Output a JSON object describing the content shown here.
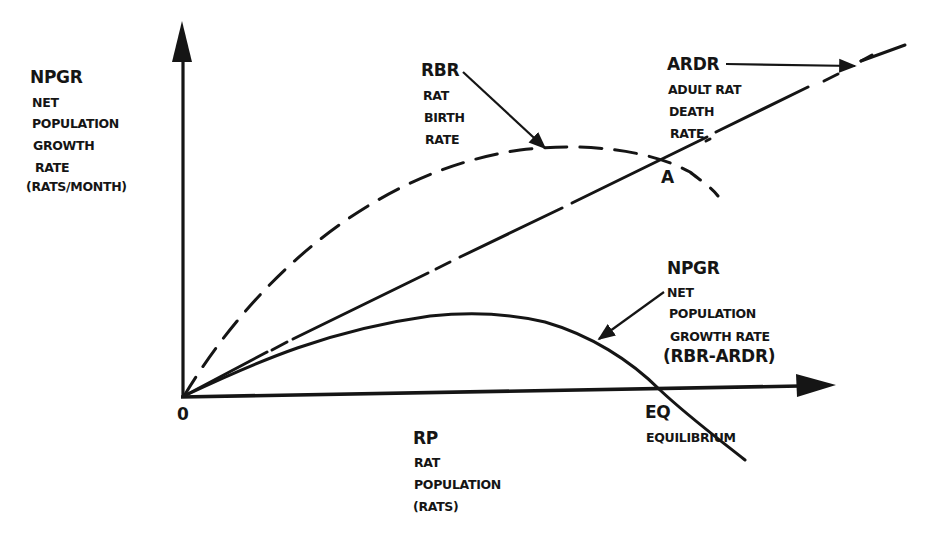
{
  "diagram": {
    "y_axis": {
      "abbr": "NPGR",
      "lines": [
        "NET",
        "POPULATION",
        "GROWTH",
        "RATE",
        "(RATS/MONTH)"
      ]
    },
    "x_axis": {
      "abbr": "RP",
      "lines": [
        "RAT",
        "POPULATION",
        "(RATS)"
      ]
    },
    "origin_label": "0",
    "rbr": {
      "abbr": "RBR",
      "lines": [
        "RAT",
        "BIRTH",
        "RATE"
      ],
      "style": "dashed"
    },
    "ardr": {
      "abbr": "ARDR",
      "lines": [
        "ADULT RAT",
        "DEATH",
        "RATE"
      ],
      "style": "solid-then-dashed straight line"
    },
    "npgr": {
      "abbr": "NPGR",
      "lines": [
        "NET",
        "POPULATION",
        "GROWTH RATE"
      ],
      "formula": "(RBR-ARDR)",
      "style": "solid"
    },
    "point_a": "A",
    "eq": {
      "abbr": "EQ",
      "label": "EQUILIBRIUM"
    },
    "colors": {
      "ink": "#151515",
      "background": "#ffffff"
    }
  }
}
